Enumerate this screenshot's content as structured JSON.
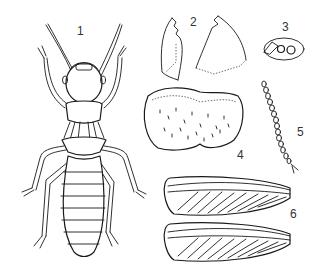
{
  "figure": {
    "type": "scientific-illustration",
    "panels": [
      {
        "label": "1",
        "part": "whole body, dorsal view"
      },
      {
        "label": "2",
        "part": "mandibles"
      },
      {
        "label": "3",
        "part": "eye and ocellus"
      },
      {
        "label": "4",
        "part": "pronotum"
      },
      {
        "label": "5",
        "part": "antenna"
      },
      {
        "label": "6",
        "part": "fore and hind wings"
      }
    ]
  },
  "colors": {
    "background": "#ffffff",
    "ink": "#1a1a1a",
    "label": "#333333"
  }
}
